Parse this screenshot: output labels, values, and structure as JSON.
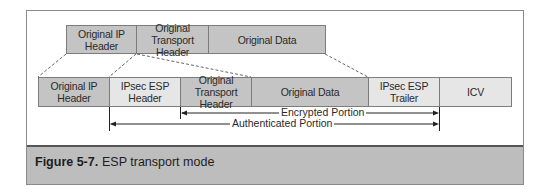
{
  "original_packet": {
    "fields": [
      {
        "label": "Original IP\nHeader",
        "line1": "Original IP",
        "line2": "Header",
        "shade": "dark"
      },
      {
        "label": "Original\nTransport Header",
        "line1": "Original",
        "line2": "Transport Header",
        "shade": "dark"
      },
      {
        "label": "Original Data",
        "line1": "Original Data",
        "line2": "",
        "shade": "dark"
      }
    ]
  },
  "esp_packet": {
    "fields": [
      {
        "line1": "Original IP",
        "line2": "Header",
        "shade": "dark"
      },
      {
        "line1": "IPsec ESP",
        "line2": "Header",
        "shade": "light"
      },
      {
        "line1": "Original",
        "line2": "Transport Header",
        "shade": "dark"
      },
      {
        "line1": "Original Data",
        "line2": "",
        "shade": "dark"
      },
      {
        "line1": "IPsec ESP Trailer",
        "line2": "",
        "shade": "light"
      },
      {
        "line1": "ICV",
        "line2": "",
        "shade": "light"
      }
    ]
  },
  "ranges": {
    "encrypted": "Encrypted Portion",
    "authenticated": "Authenticated Portion"
  },
  "caption": {
    "number": "Figure 5-7.",
    "title": "ESP transport mode"
  },
  "colors": {
    "dark_field": "#c4c4c4",
    "light_field": "#e6e6e6",
    "caption_band": "#bdbdbd"
  }
}
